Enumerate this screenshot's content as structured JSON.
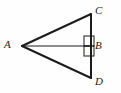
{
  "figure": {
    "background_color": "#fefefe",
    "stroke_color": "#1b1b1b",
    "labels": {
      "a": "A",
      "b": "B",
      "c": "C",
      "d": "D"
    },
    "points": {
      "A": {
        "x": 22,
        "y": 46
      },
      "B": {
        "x": 91,
        "y": 46
      },
      "C": {
        "x": 91,
        "y": 14
      },
      "D": {
        "x": 91,
        "y": 78
      }
    },
    "segments": [
      {
        "name": "segment-AC",
        "from": "A",
        "to": "C",
        "width": 2
      },
      {
        "name": "segment-AD",
        "from": "A",
        "to": "D",
        "width": 2
      },
      {
        "name": "segment-CD",
        "from": "C",
        "to": "D",
        "width": 2
      },
      {
        "name": "segment-AB",
        "from": "A",
        "to": "B",
        "width": 1
      }
    ],
    "right_angle_marks": [
      {
        "name": "right-angle-mark-upper",
        "x": 84,
        "y": 36,
        "size": 10
      },
      {
        "name": "right-angle-mark-lower",
        "x": 84,
        "y": 46,
        "size": 10
      }
    ]
  }
}
